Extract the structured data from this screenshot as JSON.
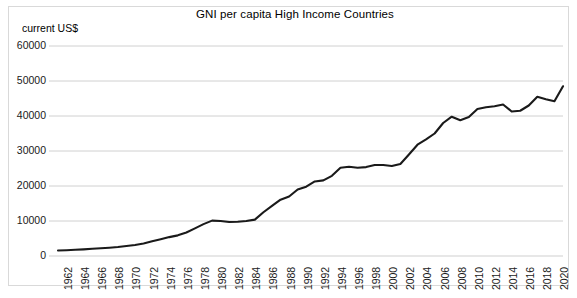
{
  "chart_data": {
    "type": "line",
    "title": "GNI per capita High Income Countries",
    "unit_label": "current US$",
    "xlabel": "",
    "ylabel": "",
    "ylim": [
      0,
      60000
    ],
    "ytick_values": [
      0,
      10000,
      20000,
      30000,
      40000,
      50000,
      60000
    ],
    "ytick_labels": [
      "0",
      "10000",
      "20000",
      "30000",
      "40000",
      "50000",
      "60000"
    ],
    "grid": true,
    "legend_position": "none",
    "line_color": "#1a1a1a",
    "grid_color": "#d0d0d0",
    "xtick_labels": [
      "1962",
      "1964",
      "1966",
      "1968",
      "1970",
      "1972",
      "1974",
      "1976",
      "1978",
      "1980",
      "1982",
      "1984",
      "1986",
      "1988",
      "1990",
      "1992",
      "1994",
      "1996",
      "1998",
      "2000",
      "2002",
      "2004",
      "2006",
      "2008",
      "2010",
      "2012",
      "2014",
      "2016",
      "2018",
      "2020"
    ],
    "x": [
      1962,
      1963,
      1964,
      1965,
      1966,
      1967,
      1968,
      1969,
      1970,
      1971,
      1972,
      1973,
      1974,
      1975,
      1976,
      1977,
      1978,
      1979,
      1980,
      1981,
      1982,
      1983,
      1984,
      1985,
      1986,
      1987,
      1988,
      1989,
      1990,
      1991,
      1992,
      1993,
      1994,
      1995,
      1996,
      1997,
      1998,
      1999,
      2000,
      2001,
      2002,
      2003,
      2004,
      2005,
      2006,
      2007,
      2008,
      2009,
      2010,
      2011,
      2012,
      2013,
      2014,
      2015,
      2016,
      2017,
      2018,
      2019,
      2020,
      2021
    ],
    "values": [
      1550,
      1650,
      1780,
      1900,
      2050,
      2200,
      2350,
      2550,
      2850,
      3150,
      3550,
      4200,
      4800,
      5400,
      5900,
      6700,
      7900,
      9100,
      10100,
      10000,
      9700,
      9800,
      10000,
      10400,
      12500,
      14300,
      16100,
      17000,
      19000,
      19800,
      21300,
      21600,
      22900,
      25200,
      25500,
      25200,
      25400,
      26000,
      26000,
      25700,
      26300,
      29000,
      31800,
      33300,
      35000,
      38000,
      39800,
      38800,
      39700,
      42000,
      42500,
      42800,
      43300,
      41300,
      41500,
      43000,
      45500,
      44800,
      44200,
      48500
    ],
    "series_name": "GNI per capita",
    "xlim": [
      1962,
      2021
    ]
  }
}
